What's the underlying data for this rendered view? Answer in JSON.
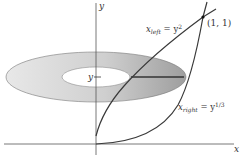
{
  "diagram": {
    "axes": {
      "x_label": "x",
      "y_label": "y"
    },
    "curves": [
      {
        "name": "left",
        "label_base": "x",
        "label_sub": "left",
        "label_eq": " = y",
        "label_sup": "2"
      },
      {
        "name": "right",
        "label_base": "x",
        "label_sub": "right",
        "label_eq": " = y",
        "label_sup": "1/3"
      }
    ],
    "point": {
      "label": "(1, 1)"
    },
    "slice_label": "y",
    "colors": {
      "washer_outer_light": "#e6e6e6",
      "washer_dark": "#9a9a9a",
      "curve": "#3a3a3a",
      "axis": "#555555"
    }
  }
}
